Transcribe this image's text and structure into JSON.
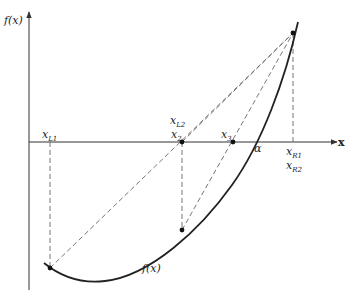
{
  "figure": {
    "type": "regula-falsi-illinois-diagram",
    "axes": {
      "y_label": "f(x)",
      "x_label": "x"
    },
    "labels": {
      "xL1": {
        "base": "x",
        "sub": "L1"
      },
      "xL2": {
        "base": "x",
        "sub": "L2"
      },
      "x2": {
        "base": "x",
        "sub": "2"
      },
      "x3": {
        "base": "x",
        "sub": "3"
      },
      "alpha": "α",
      "xR1": {
        "base": "x",
        "sub": "R1"
      },
      "xR2": {
        "base": "x",
        "sub": "R2"
      },
      "curve_label": "f(x)"
    },
    "points": [
      {
        "name": "L1-curve-point",
        "x": 50,
        "y": 268
      },
      {
        "name": "x2-axis-point",
        "x": 182,
        "y": 142
      },
      {
        "name": "x2-curve-point",
        "x": 182,
        "y": 230
      },
      {
        "name": "x3-axis-point",
        "x": 233,
        "y": 142
      },
      {
        "name": "R1-curve-point",
        "x": 293,
        "y": 33
      }
    ],
    "colors": {
      "curve": "#222222",
      "dashed": "#666666",
      "axis": "#333333"
    }
  }
}
